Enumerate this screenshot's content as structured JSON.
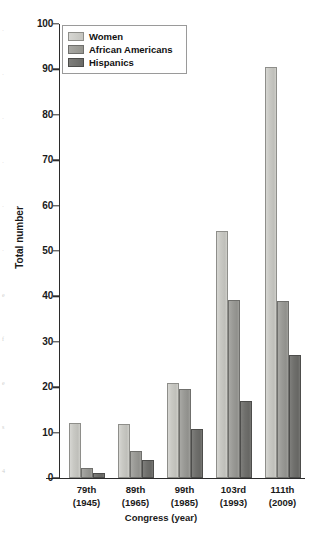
{
  "chart_data": {
    "type": "bar",
    "title": "",
    "xlabel": "Congress (year)",
    "ylabel": "Total number",
    "ylim": [
      0,
      100
    ],
    "ytick_step": 10,
    "yticks": [
      0,
      10,
      20,
      30,
      40,
      50,
      60,
      70,
      80,
      90,
      100
    ],
    "grid": false,
    "legend_position": "top-left",
    "categories": [
      "79th\n(1945)",
      "89th\n(1965)",
      "99th\n(1985)",
      "103rd\n(1993)",
      "111th\n(2009)"
    ],
    "category_parts": [
      {
        "congress": "79th",
        "year": "(1945)"
      },
      {
        "congress": "89th",
        "year": "(1965)"
      },
      {
        "congress": "99th",
        "year": "(1985)"
      },
      {
        "congress": "103rd",
        "year": "(1993)"
      },
      {
        "congress": "111th",
        "year": "(2009)"
      }
    ],
    "series": [
      {
        "name": "Women",
        "color": "#c4c4bf",
        "values": [
          12.2,
          12.0,
          21.0,
          54.3,
          90.6
        ]
      },
      {
        "name": "African Americans",
        "color": "#95958f",
        "values": [
          2.3,
          6.0,
          19.5,
          39.3,
          39.0
        ]
      },
      {
        "name": "Hispanics",
        "color": "#6a6a67",
        "values": [
          1.2,
          4.0,
          10.7,
          17.0,
          27.0
        ]
      }
    ]
  },
  "legend": {
    "items": [
      {
        "label": "Women"
      },
      {
        "label": "African Americans"
      },
      {
        "label": "Hispanics"
      }
    ]
  },
  "axes": {
    "y_title": "Total number",
    "x_title": "Congress (year)",
    "y_labels": [
      "100",
      "90",
      "80",
      "70",
      "60",
      "50",
      "40",
      "30",
      "20",
      "10",
      "0"
    ]
  },
  "edge_artifacts": [
    "·",
    "·",
    "·",
    "·",
    "·",
    "·",
    "e",
    "f",
    "e",
    "s",
    "4"
  ]
}
